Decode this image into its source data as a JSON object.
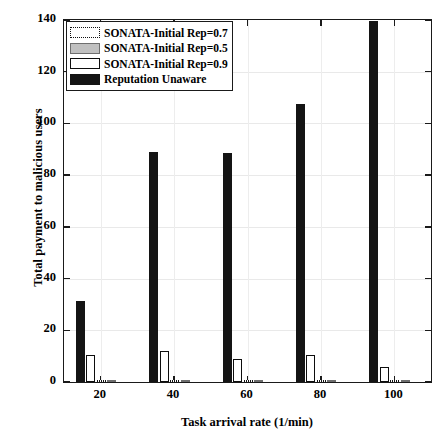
{
  "chart_data": {
    "type": "bar",
    "title": "",
    "xlabel": "Task arrival rate (1/min)",
    "ylabel": "Total payment to malicious users",
    "categories": [
      "20",
      "40",
      "60",
      "80",
      "100"
    ],
    "x": [
      20,
      40,
      60,
      80,
      100
    ],
    "xlim": [
      10,
      110
    ],
    "ylim": [
      0,
      140
    ],
    "yticks": [
      0,
      20,
      40,
      60,
      80,
      100,
      120,
      140
    ],
    "xticks": [
      20,
      40,
      60,
      80,
      100
    ],
    "grid": true,
    "legend_position": "upper left",
    "series": [
      {
        "name": "SONATA-Initial Rep=0.7",
        "style": "dotted-outline",
        "color": "#ffffff",
        "edgecolor": "#111111",
        "values": [
          0.6,
          0.7,
          0.6,
          0.7,
          0.5
        ]
      },
      {
        "name": "SONATA-Initial Rep=0.5",
        "style": "gray-fill",
        "color": "#bdbdbd",
        "edgecolor": "#6e6e6e",
        "values": [
          0.5,
          0.5,
          0.5,
          0.5,
          0.4
        ]
      },
      {
        "name": "SONATA-Initial Rep=0.9",
        "style": "white-outline",
        "color": "#ffffff",
        "edgecolor": "#0d0d0d",
        "values": [
          10.5,
          12.0,
          9.0,
          10.5,
          6.0
        ]
      },
      {
        "name": "Reputation Unaware",
        "style": "black-fill",
        "color": "#141414",
        "edgecolor": "#141414",
        "values": [
          31.5,
          89.0,
          88.5,
          107.5,
          139.5
        ]
      }
    ]
  },
  "axes": {
    "ytick_labels": [
      "0",
      "20",
      "40",
      "60",
      "80",
      "100",
      "120",
      "140"
    ],
    "xtick_labels": [
      "20",
      "40",
      "60",
      "80",
      "100"
    ],
    "ylabel": "Total payment to malicious users",
    "xlabel": "Task arrival rate (1/min)"
  },
  "legend": {
    "entries": [
      {
        "label": "SONATA-Initial Rep=0.7",
        "swatch": "dotted-outline-swatch"
      },
      {
        "label": "SONATA-Initial Rep=0.5",
        "swatch": "gray-fill-swatch"
      },
      {
        "label": "SONATA-Initial Rep=0.9",
        "swatch": "white-outline-swatch"
      },
      {
        "label": "Reputation Unaware",
        "swatch": "black-fill-swatch"
      }
    ]
  }
}
